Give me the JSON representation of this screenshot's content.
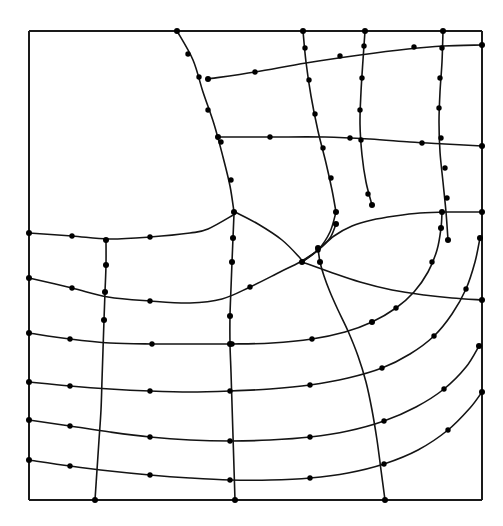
{
  "figure": {
    "kind": "finite-element-mesh",
    "background_color": "#ffffff",
    "edge_color": "#141414",
    "frame_color": "#1a1a1a",
    "node_color": "#000000",
    "edge_width": 1.6,
    "frame_width": 2.0,
    "node_radius": 3.0,
    "width": 503,
    "height": 526
  },
  "chart_data": {
    "type": "diagram",
    "subtype": "mesh",
    "xlabel": "",
    "ylabel": "",
    "grid": false,
    "legend": "none",
    "xlim": [
      29,
      482
    ],
    "ylim": [
      31,
      500
    ],
    "frame": {
      "x0": 29,
      "y0": 31,
      "x1": 482,
      "y1": 500
    },
    "counts": {
      "corner_nodes": 41,
      "midside_nodes": 57,
      "edges": 46,
      "elements": 26
    },
    "polar_center": {
      "x": 232,
      "y": 510,
      "note": "approximate focus of the radial arc family in the lower-right"
    },
    "edges": [
      {
        "id": "frame-top",
        "family": "boundary",
        "points": [
          [
            29,
            31
          ],
          [
            482,
            31
          ]
        ]
      },
      {
        "id": "frame-right",
        "family": "boundary",
        "points": [
          [
            482,
            31
          ],
          [
            482,
            500
          ]
        ]
      },
      {
        "id": "frame-bottom",
        "family": "boundary",
        "points": [
          [
            482,
            500
          ],
          [
            29,
            500
          ]
        ]
      },
      {
        "id": "frame-left",
        "family": "boundary",
        "points": [
          [
            29,
            500
          ],
          [
            29,
            31
          ]
        ]
      },
      {
        "id": "v1",
        "family": "vertical",
        "points": [
          [
            177,
            31
          ],
          [
            193,
            60
          ],
          [
            203,
            92
          ],
          [
            214,
            124
          ],
          [
            223,
            157
          ],
          [
            230,
            186
          ],
          [
            234,
            212
          ]
        ]
      },
      {
        "id": "v2-upper",
        "family": "vertical",
        "points": [
          [
            303,
            31
          ],
          [
            306,
            62
          ],
          [
            311,
            96
          ],
          [
            318,
            131
          ],
          [
            326,
            163
          ],
          [
            332,
            190
          ],
          [
            336,
            212
          ]
        ]
      },
      {
        "id": "v3-upper",
        "family": "vertical",
        "points": [
          [
            365,
            31
          ],
          [
            363,
            60
          ],
          [
            361,
            92
          ],
          [
            360,
            124
          ],
          [
            362,
            155
          ],
          [
            366,
            182
          ],
          [
            372,
            205
          ]
        ]
      },
      {
        "id": "v4",
        "family": "vertical",
        "points": [
          [
            443,
            31
          ],
          [
            442,
            62
          ],
          [
            440,
            92
          ],
          [
            439,
            122
          ],
          [
            440,
            152
          ],
          [
            443,
            182
          ],
          [
            446,
            212
          ],
          [
            448,
            240
          ]
        ]
      },
      {
        "id": "h-top-short",
        "family": "horizontal",
        "points": [
          [
            208,
            79
          ],
          [
            255,
            72
          ],
          [
            306,
            63
          ],
          [
            360,
            55
          ],
          [
            408,
            49
          ],
          [
            443,
            46
          ],
          [
            482,
            45
          ]
        ]
      },
      {
        "id": "h-mid-upper",
        "family": "horizontal",
        "points": [
          [
            218,
            137
          ],
          [
            270,
            137
          ],
          [
            325,
            137
          ],
          [
            370,
            139
          ],
          [
            410,
            142
          ],
          [
            445,
            144
          ],
          [
            482,
            146
          ]
        ]
      },
      {
        "id": "h1",
        "family": "horizontal",
        "points": [
          [
            29,
            233
          ],
          [
            72,
            236
          ],
          [
            109,
            239
          ],
          [
            150,
            237
          ],
          [
            190,
            233
          ],
          [
            208,
            229
          ],
          [
            235,
            214
          ]
        ]
      },
      {
        "id": "h2",
        "family": "horizontal",
        "points": [
          [
            29,
            278
          ],
          [
            72,
            288
          ],
          [
            108,
            297
          ],
          [
            150,
            301
          ],
          [
            190,
            303
          ],
          [
            222,
            299
          ],
          [
            250,
            287
          ],
          [
            280,
            272
          ],
          [
            300,
            262
          ],
          [
            318,
            250
          ],
          [
            330,
            238
          ],
          [
            336,
            224
          ]
        ]
      },
      {
        "id": "h3",
        "family": "horizontal",
        "points": [
          [
            29,
            333
          ],
          [
            70,
            339
          ],
          [
            110,
            343
          ],
          [
            152,
            344
          ],
          [
            192,
            344
          ],
          [
            232,
            344
          ],
          [
            272,
            343
          ],
          [
            312,
            339
          ],
          [
            345,
            332
          ],
          [
            372,
            322
          ],
          [
            396,
            308
          ],
          [
            414,
            292
          ],
          [
            428,
            272
          ],
          [
            437,
            250
          ],
          [
            441,
            228
          ],
          [
            442,
            212
          ]
        ]
      },
      {
        "id": "h4",
        "family": "horizontal",
        "points": [
          [
            29,
            382
          ],
          [
            70,
            386
          ],
          [
            110,
            389
          ],
          [
            150,
            391
          ],
          [
            190,
            392
          ],
          [
            230,
            391
          ],
          [
            270,
            389
          ],
          [
            310,
            385
          ],
          [
            348,
            378
          ],
          [
            382,
            368
          ],
          [
            410,
            354
          ],
          [
            434,
            336
          ],
          [
            452,
            314
          ],
          [
            466,
            289
          ],
          [
            475,
            262
          ],
          [
            480,
            238
          ]
        ]
      },
      {
        "id": "h5",
        "family": "horizontal",
        "points": [
          [
            29,
            420
          ],
          [
            70,
            426
          ],
          [
            110,
            432
          ],
          [
            150,
            437
          ],
          [
            190,
            440
          ],
          [
            230,
            441
          ],
          [
            270,
            440
          ],
          [
            310,
            437
          ],
          [
            348,
            431
          ],
          [
            384,
            421
          ],
          [
            416,
            407
          ],
          [
            444,
            389
          ],
          [
            466,
            367
          ],
          [
            479,
            346
          ]
        ]
      },
      {
        "id": "h6",
        "family": "horizontal",
        "points": [
          [
            29,
            460
          ],
          [
            70,
            466
          ],
          [
            110,
            471
          ],
          [
            150,
            475
          ],
          [
            190,
            478
          ],
          [
            230,
            480
          ],
          [
            270,
            480
          ],
          [
            310,
            478
          ],
          [
            348,
            473
          ],
          [
            384,
            464
          ],
          [
            418,
            450
          ],
          [
            448,
            430
          ],
          [
            470,
            408
          ],
          [
            482,
            392
          ]
        ]
      },
      {
        "id": "vb1",
        "family": "vertical",
        "points": [
          [
            95,
            500
          ],
          [
            97,
            470
          ],
          [
            99,
            440
          ],
          [
            101,
            410
          ],
          [
            102,
            380
          ],
          [
            103,
            350
          ],
          [
            104,
            320
          ],
          [
            105,
            292
          ],
          [
            106,
            265
          ],
          [
            106,
            240
          ]
        ]
      },
      {
        "id": "vb2",
        "family": "vertical",
        "points": [
          [
            235,
            500
          ],
          [
            234,
            468
          ],
          [
            233,
            436
          ],
          [
            232,
            404
          ],
          [
            231,
            372
          ],
          [
            230,
            344
          ],
          [
            230,
            316
          ],
          [
            231,
            288
          ],
          [
            232,
            262
          ],
          [
            233,
            238
          ],
          [
            234,
            214
          ]
        ]
      },
      {
        "id": "vb3",
        "family": "vertical",
        "points": [
          [
            385,
            500
          ],
          [
            381,
            470
          ],
          [
            377,
            440
          ],
          [
            372,
            410
          ],
          [
            366,
            382
          ],
          [
            358,
            356
          ],
          [
            348,
            331
          ],
          [
            338,
            310
          ],
          [
            330,
            292
          ],
          [
            324,
            276
          ],
          [
            320,
            262
          ],
          [
            318,
            248
          ]
        ]
      },
      {
        "id": "r1",
        "family": "radial",
        "points": [
          [
            235,
            212
          ],
          [
            258,
            224
          ],
          [
            282,
            240
          ],
          [
            300,
            258
          ],
          [
            302,
            262
          ]
        ]
      },
      {
        "id": "r2",
        "family": "radial",
        "points": [
          [
            302,
            262
          ],
          [
            318,
            250
          ],
          [
            334,
            236
          ],
          [
            352,
            226
          ],
          [
            372,
            220
          ],
          [
            395,
            216
          ],
          [
            420,
            213
          ],
          [
            448,
            212
          ],
          [
            482,
            212
          ]
        ]
      },
      {
        "id": "r3",
        "family": "radial",
        "points": [
          [
            302,
            262
          ],
          [
            330,
            272
          ],
          [
            360,
            282
          ],
          [
            392,
            290
          ],
          [
            424,
            295
          ],
          [
            452,
            298
          ],
          [
            482,
            300
          ]
        ]
      },
      {
        "id": "diag-hook",
        "family": "radial",
        "points": [
          [
            336,
            212
          ],
          [
            330,
            232
          ],
          [
            318,
            250
          ],
          [
            302,
            262
          ]
        ]
      }
    ],
    "nodes": {
      "corner": [
        [
          177,
          31
        ],
        [
          303,
          31
        ],
        [
          365,
          31
        ],
        [
          443,
          31
        ],
        [
          208,
          79
        ],
        [
          218,
          137
        ],
        [
          234,
          212
        ],
        [
          336,
          212
        ],
        [
          302,
          262
        ],
        [
          29,
          233
        ],
        [
          106,
          240
        ],
        [
          29,
          278
        ],
        [
          29,
          333
        ],
        [
          29,
          382
        ],
        [
          29,
          420
        ],
        [
          29,
          460
        ],
        [
          95,
          500
        ],
        [
          235,
          500
        ],
        [
          385,
          500
        ],
        [
          482,
          45
        ],
        [
          482,
          146
        ],
        [
          482,
          212
        ],
        [
          482,
          300
        ],
        [
          482,
          392
        ],
        [
          104,
          320
        ],
        [
          230,
          344
        ],
        [
          320,
          262
        ],
        [
          318,
          248
        ],
        [
          105,
          292
        ],
        [
          230,
          316
        ],
        [
          372,
          205
        ],
        [
          448,
          240
        ],
        [
          442,
          212
        ],
        [
          480,
          238
        ],
        [
          479,
          346
        ],
        [
          336,
          224
        ],
        [
          441,
          228
        ],
        [
          106,
          265
        ],
        [
          232,
          262
        ],
        [
          233,
          238
        ],
        [
          372,
          322
        ]
      ],
      "midside": [
        [
          188,
          54
        ],
        [
          199,
          77
        ],
        [
          208,
          110
        ],
        [
          221,
          142
        ],
        [
          231,
          180
        ],
        [
          305,
          48
        ],
        [
          309,
          80
        ],
        [
          315,
          114
        ],
        [
          323,
          148
        ],
        [
          331,
          178
        ],
        [
          364,
          46
        ],
        [
          362,
          78
        ],
        [
          360,
          110
        ],
        [
          361,
          140
        ],
        [
          368,
          194
        ],
        [
          442,
          48
        ],
        [
          440,
          78
        ],
        [
          439,
          108
        ],
        [
          441,
          138
        ],
        [
          445,
          168
        ],
        [
          447,
          198
        ],
        [
          255,
          72
        ],
        [
          340,
          56
        ],
        [
          414,
          47
        ],
        [
          270,
          137
        ],
        [
          350,
          138
        ],
        [
          422,
          143
        ],
        [
          72,
          236
        ],
        [
          150,
          237
        ],
        [
          72,
          288
        ],
        [
          150,
          301
        ],
        [
          250,
          287
        ],
        [
          318,
          250
        ],
        [
          70,
          339
        ],
        [
          152,
          344
        ],
        [
          232,
          344
        ],
        [
          312,
          339
        ],
        [
          396,
          308
        ],
        [
          432,
          262
        ],
        [
          70,
          386
        ],
        [
          150,
          391
        ],
        [
          230,
          391
        ],
        [
          310,
          385
        ],
        [
          382,
          368
        ],
        [
          434,
          336
        ],
        [
          466,
          289
        ],
        [
          70,
          426
        ],
        [
          150,
          437
        ],
        [
          230,
          441
        ],
        [
          310,
          437
        ],
        [
          384,
          421
        ],
        [
          444,
          389
        ],
        [
          70,
          466
        ],
        [
          150,
          475
        ],
        [
          230,
          480
        ],
        [
          310,
          478
        ],
        [
          384,
          464
        ],
        [
          448,
          430
        ]
      ]
    }
  }
}
